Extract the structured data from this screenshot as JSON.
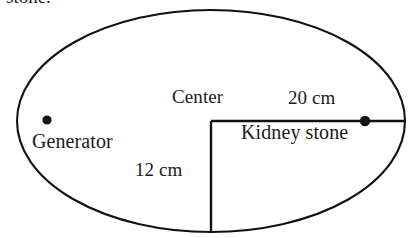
{
  "figure": {
    "title_clipped": "stone.",
    "background_color": "#ffffff",
    "stroke_color": "#111111",
    "labels": {
      "center": "Center",
      "horizontal_distance": "20 cm",
      "vertical_distance": "12 cm",
      "kidney_stone": "Kidney stone",
      "generator": "Generator"
    },
    "points": {
      "generator_dot": "generator-point",
      "kidney_stone_dot": "kidney-stone-point"
    },
    "geometry": {
      "ellipse_center_x": 211,
      "ellipse_center_y": 121,
      "ellipse_radius_x": 194,
      "ellipse_radius_y": 111,
      "generator_dot_x": 47,
      "generator_dot_y": 120,
      "stone_dot_x": 365,
      "stone_dot_y": 121,
      "horizontal_line_from_x": 211,
      "horizontal_line_to_x": 405,
      "vertical_line_from_y": 121,
      "vertical_line_to_y": 232
    }
  }
}
